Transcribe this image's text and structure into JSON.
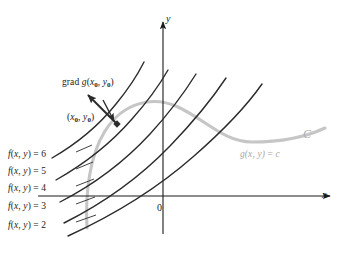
{
  "figure": {
    "background": "#ffffff"
  },
  "axes": {
    "x_label": "x",
    "y_label": "y",
    "origin_label": "0",
    "axis_color": "#1b1b1b",
    "x_axis": {
      "x1": 38,
      "y1": 196,
      "x2": 330,
      "y2": 196
    },
    "y_axis": {
      "x1": 163,
      "y1": 234,
      "x2": 163,
      "y2": 22
    }
  },
  "annotations": {
    "gradient_label": "grad g(x₀, y₀)",
    "gradient_label_parts": {
      "prefix": "grad ",
      "func": "g",
      "open": "(",
      "var1": "x",
      "sub1": "0",
      "comma": ", ",
      "var2": "y",
      "sub2": "0",
      "close": ")"
    },
    "point_label": "(x₀, y₀)",
    "point_label_parts": {
      "open": "(",
      "var1": "x",
      "sub1": "0",
      "comma": ", ",
      "var2": "y",
      "sub2": "0",
      "close": ")"
    },
    "curve_name": "C",
    "constraint_label": "g(x, y) = c",
    "constraint_label_parts": {
      "func": "g",
      "args": "(x, y)",
      "equals": " = ",
      "value": "c"
    },
    "point_marker": {
      "x": 117,
      "y": 124
    },
    "gradient_arrow": {
      "x1": 117,
      "y1": 124,
      "x2": 88,
      "y2": 95
    },
    "pointer_arrow": {
      "x1": 103,
      "y1": 100,
      "x2": 114,
      "y2": 121
    }
  },
  "colors": {
    "level_curve": "#2b2b2b",
    "constraint_curve": "#c6c6c6",
    "text": "#1b1b1b",
    "gray_text": "#a8a8a8",
    "curve_c_text": "#b0b0b0"
  },
  "chart_data": {
    "type": "line",
    "xlabel": "x",
    "ylabel": "y",
    "grid": false,
    "legend": "inline-labels",
    "origin_label": "0",
    "level_curves": [
      {
        "label": "f(x, y) = 6",
        "value": 6,
        "label_x": 8,
        "label_y": 150,
        "leader": {
          "x1": 76,
          "y1": 152,
          "x2": 92,
          "y2": 145
        }
      },
      {
        "label": "f(x, y) = 5",
        "value": 5,
        "label_x": 8,
        "label_y": 167,
        "leader": {
          "x1": 76,
          "y1": 169,
          "x2": 93,
          "y2": 162
        }
      },
      {
        "label": "f(x, y) = 4",
        "value": 4,
        "label_x": 8,
        "label_y": 184,
        "leader": {
          "x1": 76,
          "y1": 186,
          "x2": 94,
          "y2": 179
        }
      },
      {
        "label": "f(x, y) = 3",
        "value": 3,
        "label_x": 8,
        "label_y": 202,
        "leader": {
          "x1": 76,
          "y1": 204,
          "x2": 95,
          "y2": 197
        }
      },
      {
        "label": "f(x, y) = 2",
        "value": 2,
        "label_x": 8,
        "label_y": 221,
        "leader": {
          "x1": 76,
          "y1": 222,
          "x2": 96,
          "y2": 215
        }
      }
    ],
    "level_curve_paths": [
      "M 52,158 C 78,143 100,124 116,104 C 130,87 138,74 144,62",
      "M 56,180 C 86,163 112,142 132,119 C 149,100 160,84 168,70",
      "M 60,202 C 95,184 126,160 150,134 C 172,110 186,90 196,74",
      "M 64,223 C 104,203 142,175 170,146 C 196,119 214,96 226,78",
      "M 68,236 C 116,214 160,186 194,156 C 226,128 248,104 262,84"
    ],
    "constraint_curve_path": "M 87,228 C 85,192 90,155 105,131 C 124,101 154,96 178,107 C 206,120 224,142 252,142 C 283,142 308,136 325,128",
    "constraint_value": "c",
    "annotations": [
      {
        "text": "grad g(x₀, y₀)",
        "x": 62,
        "y": 82
      },
      {
        "text": "(x₀, y₀)",
        "x": 67,
        "y": 117
      },
      {
        "text": "C",
        "x": 305,
        "y": 136
      },
      {
        "text": "g(x, y) = c",
        "x": 240,
        "y": 155
      }
    ]
  }
}
